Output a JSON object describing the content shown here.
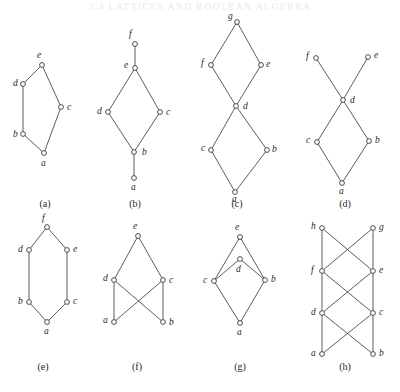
{
  "figure": {
    "header_text": "2.4   LATTICES AND BOOLEAN ALGEBRA",
    "width": 400,
    "height": 392,
    "line_color": "#4a4a52",
    "node_fill": "#ffffff",
    "node_stroke": "#3a3a42",
    "label_color": "#1f1f24"
  },
  "panels": [
    {
      "id": "a",
      "caption": "(a)",
      "caption_x": 45,
      "caption_y": 207,
      "nodes": [
        {
          "label": "e",
          "x": 42,
          "y": 65,
          "lx": 37,
          "ly": 58
        },
        {
          "label": "d",
          "x": 23,
          "y": 84,
          "lx": 13,
          "ly": 86
        },
        {
          "label": "c",
          "x": 61,
          "y": 107,
          "lx": 67,
          "ly": 110
        },
        {
          "label": "b",
          "x": 23,
          "y": 134,
          "lx": 13,
          "ly": 137
        },
        {
          "label": "a",
          "x": 44,
          "y": 153,
          "lx": 41,
          "ly": 166
        }
      ],
      "edges": [
        [
          "a",
          "b"
        ],
        [
          "a",
          "c"
        ],
        [
          "b",
          "d"
        ],
        [
          "d",
          "e"
        ],
        [
          "c",
          "e"
        ]
      ]
    },
    {
      "id": "b",
      "caption": "(b)",
      "caption_x": 135,
      "caption_y": 207,
      "nodes": [
        {
          "label": "f",
          "x": 135,
          "y": 44,
          "lx": 129,
          "ly": 37
        },
        {
          "label": "e",
          "x": 135,
          "y": 68,
          "lx": 124,
          "ly": 68
        },
        {
          "label": "d",
          "x": 108,
          "y": 112,
          "lx": 97,
          "ly": 114
        },
        {
          "label": "c",
          "x": 160,
          "y": 112,
          "lx": 166,
          "ly": 115
        },
        {
          "label": "b",
          "x": 134,
          "y": 152,
          "lx": 142,
          "ly": 155
        },
        {
          "label": "a",
          "x": 134,
          "y": 178,
          "lx": 131,
          "ly": 190
        }
      ],
      "edges": [
        [
          "a",
          "b"
        ],
        [
          "b",
          "d"
        ],
        [
          "b",
          "c"
        ],
        [
          "d",
          "e"
        ],
        [
          "c",
          "e"
        ],
        [
          "e",
          "f"
        ]
      ]
    },
    {
      "id": "c",
      "caption": "(c)",
      "caption_x": 237,
      "caption_y": 207,
      "nodes": [
        {
          "label": "g",
          "x": 237,
          "y": 22,
          "lx": 228,
          "ly": 19
        },
        {
          "label": "f",
          "x": 211,
          "y": 65,
          "lx": 201,
          "ly": 66
        },
        {
          "label": "e",
          "x": 261,
          "y": 65,
          "lx": 266,
          "ly": 67
        },
        {
          "label": "d",
          "x": 236,
          "y": 106,
          "lx": 243,
          "ly": 109
        },
        {
          "label": "c",
          "x": 211,
          "y": 150,
          "lx": 201,
          "ly": 151
        },
        {
          "label": "b",
          "x": 267,
          "y": 150,
          "lx": 272,
          "ly": 152
        },
        {
          "label": "a",
          "x": 235,
          "y": 192,
          "lx": 232,
          "ly": 202
        }
      ],
      "edges": [
        [
          "a",
          "c"
        ],
        [
          "a",
          "b"
        ],
        [
          "c",
          "d"
        ],
        [
          "b",
          "d"
        ],
        [
          "d",
          "f"
        ],
        [
          "d",
          "e"
        ],
        [
          "f",
          "g"
        ],
        [
          "e",
          "g"
        ]
      ]
    },
    {
      "id": "d",
      "caption": "(d)",
      "caption_x": 345,
      "caption_y": 207,
      "nodes": [
        {
          "label": "f",
          "x": 316,
          "y": 58,
          "lx": 306,
          "ly": 59
        },
        {
          "label": "e",
          "x": 368,
          "y": 57,
          "lx": 374,
          "ly": 58
        },
        {
          "label": "d",
          "x": 343,
          "y": 100,
          "lx": 350,
          "ly": 103
        },
        {
          "label": "c",
          "x": 317,
          "y": 142,
          "lx": 306,
          "ly": 143
        },
        {
          "label": "b",
          "x": 369,
          "y": 141,
          "lx": 375,
          "ly": 143
        },
        {
          "label": "a",
          "x": 342,
          "y": 183,
          "lx": 339,
          "ly": 194
        }
      ],
      "edges": [
        [
          "a",
          "c"
        ],
        [
          "a",
          "b"
        ],
        [
          "c",
          "d"
        ],
        [
          "b",
          "d"
        ],
        [
          "d",
          "f"
        ],
        [
          "d",
          "e"
        ]
      ]
    },
    {
      "id": "e",
      "caption": "(e)",
      "caption_x": 43,
      "caption_y": 370,
      "nodes": [
        {
          "label": "f",
          "x": 47,
          "y": 227,
          "lx": 42,
          "ly": 221
        },
        {
          "label": "d",
          "x": 29,
          "y": 250,
          "lx": 18,
          "ly": 252
        },
        {
          "label": "e",
          "x": 67,
          "y": 250,
          "lx": 73,
          "ly": 252
        },
        {
          "label": "b",
          "x": 29,
          "y": 302,
          "lx": 18,
          "ly": 304
        },
        {
          "label": "c",
          "x": 67,
          "y": 302,
          "lx": 73,
          "ly": 304
        },
        {
          "label": "a",
          "x": 47,
          "y": 322,
          "lx": 44,
          "ly": 334
        }
      ],
      "edges": [
        [
          "a",
          "b"
        ],
        [
          "a",
          "c"
        ],
        [
          "b",
          "d"
        ],
        [
          "c",
          "e"
        ],
        [
          "d",
          "f"
        ],
        [
          "e",
          "f"
        ]
      ]
    },
    {
      "id": "f",
      "caption": "(f)",
      "caption_x": 137,
      "caption_y": 370,
      "nodes": [
        {
          "label": "e",
          "x": 138,
          "y": 236,
          "lx": 133,
          "ly": 229
        },
        {
          "label": "d",
          "x": 114,
          "y": 280,
          "lx": 103,
          "ly": 281
        },
        {
          "label": "c",
          "x": 163,
          "y": 280,
          "lx": 169,
          "ly": 283
        },
        {
          "label": "a",
          "x": 114,
          "y": 322,
          "lx": 103,
          "ly": 323
        },
        {
          "label": "b",
          "x": 163,
          "y": 322,
          "lx": 169,
          "ly": 325
        }
      ],
      "edges": [
        [
          "a",
          "d"
        ],
        [
          "a",
          "c"
        ],
        [
          "b",
          "c"
        ],
        [
          "b",
          "d"
        ],
        [
          "d",
          "e"
        ],
        [
          "c",
          "e"
        ]
      ]
    },
    {
      "id": "g",
      "caption": "(g)",
      "caption_x": 240,
      "caption_y": 370,
      "nodes": [
        {
          "label": "e",
          "x": 240,
          "y": 237,
          "lx": 235,
          "ly": 230
        },
        {
          "label": "d",
          "x": 240,
          "y": 259,
          "lx": 236,
          "ly": 272
        },
        {
          "label": "c",
          "x": 214,
          "y": 281,
          "lx": 203,
          "ly": 283
        },
        {
          "label": "b",
          "x": 265,
          "y": 280,
          "lx": 271,
          "ly": 282
        },
        {
          "label": "a",
          "x": 240,
          "y": 323,
          "lx": 237,
          "ly": 335
        }
      ],
      "edges": [
        [
          "a",
          "c"
        ],
        [
          "a",
          "b"
        ],
        [
          "c",
          "d"
        ],
        [
          "b",
          "d"
        ],
        [
          "c",
          "e"
        ],
        [
          "b",
          "e"
        ]
      ]
    },
    {
      "id": "h",
      "caption": "(h)",
      "caption_x": 345,
      "caption_y": 370,
      "nodes": [
        {
          "label": "h",
          "x": 322,
          "y": 228,
          "lx": 311,
          "ly": 229
        },
        {
          "label": "g",
          "x": 373,
          "y": 228,
          "lx": 379,
          "ly": 230
        },
        {
          "label": "f",
          "x": 322,
          "y": 271,
          "lx": 311,
          "ly": 273
        },
        {
          "label": "e",
          "x": 373,
          "y": 271,
          "lx": 379,
          "ly": 273
        },
        {
          "label": "d",
          "x": 322,
          "y": 313,
          "lx": 311,
          "ly": 315
        },
        {
          "label": "c",
          "x": 373,
          "y": 313,
          "lx": 379,
          "ly": 315
        },
        {
          "label": "a",
          "x": 322,
          "y": 354,
          "lx": 311,
          "ly": 356
        },
        {
          "label": "b",
          "x": 373,
          "y": 354,
          "lx": 379,
          "ly": 356
        }
      ],
      "edges": [
        [
          "a",
          "d"
        ],
        [
          "a",
          "c"
        ],
        [
          "b",
          "c"
        ],
        [
          "b",
          "d"
        ],
        [
          "d",
          "f"
        ],
        [
          "d",
          "e"
        ],
        [
          "c",
          "e"
        ],
        [
          "c",
          "f"
        ],
        [
          "f",
          "h"
        ],
        [
          "f",
          "g"
        ],
        [
          "e",
          "g"
        ],
        [
          "e",
          "h"
        ]
      ]
    }
  ]
}
